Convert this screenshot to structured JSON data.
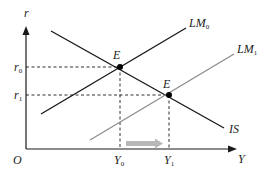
{
  "diagram": {
    "type": "IS-LM",
    "axes": {
      "y_label": "r",
      "x_label": "Y",
      "origin_label": "O"
    },
    "curves": [
      {
        "id": "IS",
        "label": "IS",
        "label_sub": "",
        "color": "#1a1a1a"
      },
      {
        "id": "LM0",
        "label": "LM",
        "label_sub": "0",
        "color": "#1a1a1a"
      },
      {
        "id": "LM1",
        "label": "LM",
        "label_sub": "1",
        "color": "#8a8a8a"
      }
    ],
    "equilibria": [
      {
        "id": "E0",
        "label": "E",
        "label_sub": "0"
      },
      {
        "id": "E1",
        "label": "E",
        "label_sub": "1"
      }
    ],
    "y_ticks": [
      {
        "label": "r",
        "sub": "0"
      },
      {
        "label": "r",
        "sub": "1"
      }
    ],
    "x_ticks": [
      {
        "label": "Y",
        "sub": "0"
      },
      {
        "label": "Y",
        "sub": "1"
      }
    ],
    "shift_arrow": {
      "color": "#b8b8b8",
      "direction": "right"
    }
  }
}
